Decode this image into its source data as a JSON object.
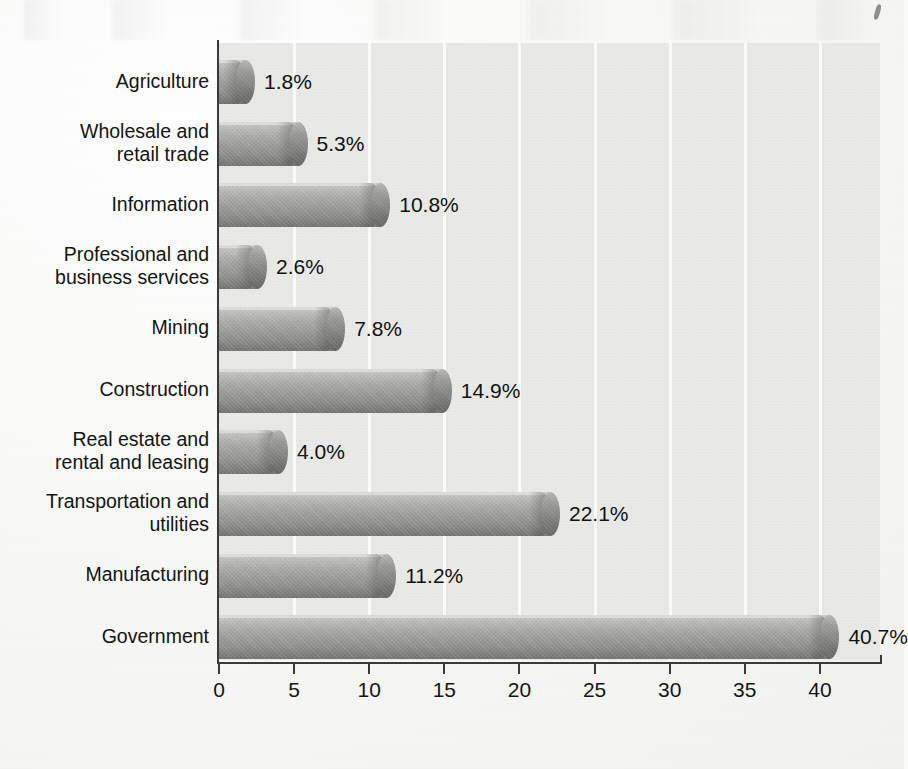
{
  "chart_data": {
    "type": "bar",
    "orientation": "horizontal",
    "title": "",
    "subtitle": "",
    "xlabel": "",
    "ylabel": "",
    "xlim": [
      0,
      44
    ],
    "ylim": null,
    "grid": true,
    "legend": null,
    "value_suffix": "%",
    "xticks": [
      0,
      5,
      10,
      15,
      20,
      25,
      30,
      35,
      40
    ],
    "xtick_labels": [
      "0",
      "5",
      "10",
      "15",
      "20",
      "25",
      "30",
      "35",
      "40"
    ],
    "categories": [
      "Agriculture",
      "Wholesale and\nretail trade",
      "Information",
      "Professional and\nbusiness services",
      "Mining",
      "Construction",
      "Real estate and\nrental and leasing",
      "Transportation and\nutilities",
      "Manufacturing",
      "Government"
    ],
    "values": [
      1.8,
      5.3,
      10.8,
      2.6,
      7.8,
      14.9,
      4.0,
      22.1,
      11.2,
      40.7
    ],
    "data_labels": [
      "1.8%",
      "5.3%",
      "10.8%",
      "2.6%",
      "7.8%",
      "14.9%",
      "4.0%",
      "22.1%",
      "11.2%",
      "40.7%"
    ],
    "colors": {
      "bar_light": "#d3d3d1",
      "bar_mid": "#9b9b99",
      "bar_dark": "#747472",
      "bar_cap": "#85857f",
      "plot_background": "#e9e9e7",
      "gridline": "#fcfcfb",
      "axis": "#3a3a3a",
      "text": "#141414",
      "page_background": "#f7f7f5"
    }
  }
}
